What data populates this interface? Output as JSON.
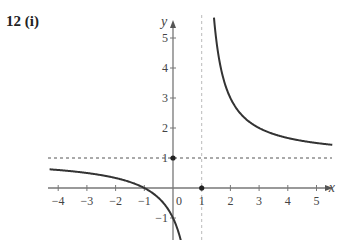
{
  "title": "12 (i)",
  "chart_data": {
    "type": "line",
    "title": "12 (i)",
    "function": "y = (x+1)/(x-1)",
    "xlabel": "x",
    "ylabel": "y",
    "xlim": [
      -4.3,
      5.6
    ],
    "ylim": [
      -1.6,
      5.6
    ],
    "x_ticks": [
      -4,
      -3,
      -2,
      -1,
      0,
      1,
      2,
      3,
      4,
      5
    ],
    "x_tick_labels": [
      "−4",
      "−3",
      "−2",
      "−1",
      "0",
      "1",
      "2",
      "3",
      "4",
      "5"
    ],
    "y_ticks": [
      -1,
      1,
      2,
      3,
      4,
      5
    ],
    "y_tick_labels": [
      "−1",
      "1",
      "2",
      "3",
      "4",
      "5"
    ],
    "asymptotes": [
      {
        "type": "vertical",
        "x": 1,
        "style": "dashed",
        "color": "#bbbbbb"
      },
      {
        "type": "horizontal",
        "y": 1,
        "style": "dashed",
        "color": "#555555"
      }
    ],
    "marked_points": [
      {
        "x": 0,
        "y": 1
      },
      {
        "x": 1,
        "y": 0
      }
    ],
    "series": [
      {
        "name": "left branch",
        "x": [
          -4.3,
          -4,
          -3,
          -2,
          -1,
          -0.5,
          0,
          0.2
        ],
        "y": [
          0.623,
          0.6,
          0.5,
          0.333,
          0,
          -0.333,
          -1,
          -1.5
        ]
      },
      {
        "name": "right branch",
        "x": [
          1.37,
          1.5,
          2,
          3,
          4,
          5,
          5.5
        ],
        "y": [
          6.4,
          5,
          3,
          2,
          1.667,
          1.5,
          1.444
        ]
      }
    ],
    "grid": false,
    "curve_color": "#333333"
  }
}
